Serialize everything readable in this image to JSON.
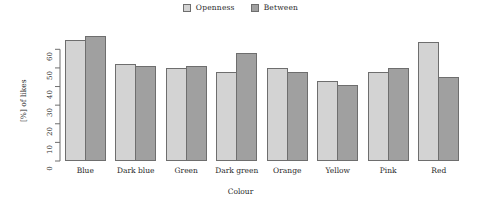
{
  "chart_data": {
    "type": "bar",
    "title": "",
    "xlabel": "Colour",
    "ylabel": "[%] of likes",
    "categories": [
      "Blue",
      "Dark blue",
      "Green",
      "Dark green",
      "Orange",
      "Yellow",
      "Pink",
      "Red"
    ],
    "series": [
      {
        "name": "Openness",
        "color": "#d3d3d3",
        "values": [
          65,
          52,
          50,
          48,
          50,
          43,
          48,
          64
        ]
      },
      {
        "name": "Between",
        "color": "#a0a0a0",
        "values": [
          67,
          51,
          51,
          58,
          48,
          41,
          50,
          45
        ]
      }
    ],
    "ylim": [
      0,
      65
    ],
    "yticks": [
      0,
      10,
      20,
      30,
      40,
      50,
      60
    ],
    "ytick_labels": [
      "0",
      "10",
      "20",
      "30",
      "40",
      "50",
      "60"
    ],
    "grid": false,
    "legend_position": "top-center",
    "bar_border_color": "#6e6e6e",
    "axis_color": "#6e6e6e",
    "background": "#ffffff"
  },
  "legend": {
    "entries": [
      {
        "label": "Openness",
        "swatch": "legend-swatch-openness"
      },
      {
        "label": "Between",
        "swatch": "legend-swatch-between"
      }
    ]
  },
  "axes": {
    "y_title": "[%] of likes",
    "x_title": "Colour"
  }
}
